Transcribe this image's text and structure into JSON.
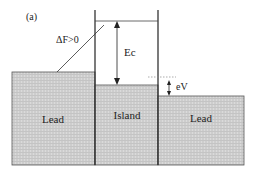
{
  "panel_label": "(a)",
  "labels": {
    "delta_f": "ΔF>0",
    "ec": "Ec",
    "ev": "eV",
    "left_lead": "Lead",
    "island": "Island",
    "right_lead": "Lead"
  },
  "colors": {
    "fill": "#cfcfcf",
    "line": "#222222",
    "dotted": "#888888"
  }
}
